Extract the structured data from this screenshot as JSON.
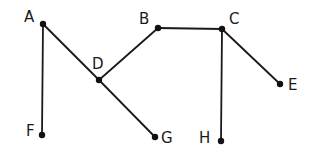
{
  "diagram": {
    "type": "graph",
    "nodes": [
      {
        "id": "A",
        "label": "A",
        "x": 43,
        "y": 24,
        "lx": 24,
        "ly": 22
      },
      {
        "id": "B",
        "label": "B",
        "x": 158,
        "y": 28,
        "lx": 139,
        "ly": 24
      },
      {
        "id": "C",
        "label": "C",
        "x": 222,
        "y": 29,
        "lx": 229,
        "ly": 24
      },
      {
        "id": "D",
        "label": "D",
        "x": 99,
        "y": 80,
        "lx": 92,
        "ly": 69
      },
      {
        "id": "E",
        "label": "E",
        "x": 280,
        "y": 84,
        "lx": 288,
        "ly": 90
      },
      {
        "id": "F",
        "label": "F",
        "x": 42,
        "y": 135,
        "lx": 26,
        "ly": 136
      },
      {
        "id": "G",
        "label": "G",
        "x": 155,
        "y": 137,
        "lx": 161,
        "ly": 143
      },
      {
        "id": "H",
        "label": "H",
        "x": 221,
        "y": 141,
        "lx": 199,
        "ly": 143
      }
    ],
    "edges": [
      {
        "from": "A",
        "to": "F"
      },
      {
        "from": "A",
        "to": "D"
      },
      {
        "from": "D",
        "to": "G"
      },
      {
        "from": "D",
        "to": "B"
      },
      {
        "from": "B",
        "to": "C"
      },
      {
        "from": "C",
        "to": "E"
      },
      {
        "from": "C",
        "to": "H"
      }
    ]
  }
}
